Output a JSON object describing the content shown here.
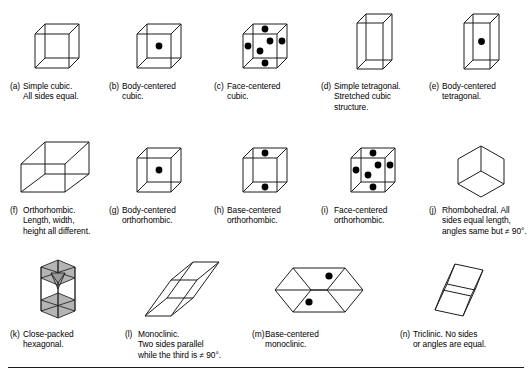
{
  "figure": {
    "rule_color": "#1b1b1b",
    "line_color": "#1d1d1d",
    "shade_color": "#b4b4b4",
    "dot_color": "#000000"
  },
  "rows": [
    {
      "cells": [
        {
          "letter": "(a)",
          "name": "simple-cubic",
          "caption": "Simple cubic.\nAll sides equal.",
          "diagram": "cube-plain",
          "dots": 0
        },
        {
          "letter": "(b)",
          "name": "body-centered-cubic",
          "caption": "Body-centered\ncubic.",
          "diagram": "cube-body-centered",
          "dots": 1
        },
        {
          "letter": "(c)",
          "name": "face-centered-cubic",
          "caption": "Face-centered\ncubic.",
          "diagram": "cube-face-centered",
          "dots": 6
        },
        {
          "letter": "(d)",
          "name": "simple-tetragonal",
          "caption": "Simple tetragonal.\nStretched cubic\nstructure.",
          "diagram": "tetragonal-plain",
          "dots": 0
        },
        {
          "letter": "(e)",
          "name": "body-centered-tetragonal",
          "caption": "Body-centered\ntetragonal.",
          "diagram": "tetragonal-body-centered",
          "dots": 1
        }
      ]
    },
    {
      "cells": [
        {
          "letter": "(f)",
          "name": "orthorhombic",
          "caption": "Orthorhombic.\nLength, width,\nheight all different.",
          "diagram": "orthorhombic-plain",
          "dots": 0
        },
        {
          "letter": "(g)",
          "name": "body-centered-orthorhombic",
          "caption": "Body-centered\northorhombic.",
          "diagram": "cube-body-centered",
          "dots": 1
        },
        {
          "letter": "(h)",
          "name": "base-centered-orthorhombic",
          "caption": "Base-centered\northorhombic.",
          "diagram": "cube-base-centered",
          "dots": 2
        },
        {
          "letter": "(i)",
          "name": "face-centered-orthorhombic",
          "caption": "Face-centered\northorhombic.",
          "diagram": "cube-face-centered",
          "dots": 6
        },
        {
          "letter": "(j)",
          "name": "rhombohedral",
          "caption": "Rhombohedral. All\nsides equal length,\nangles same but ≠ 90°.",
          "diagram": "rhombohedral",
          "dots": 0
        }
      ]
    },
    {
      "cells": [
        {
          "letter": "(k)",
          "name": "close-packed-hexagonal",
          "caption": "Close-packed\nhexagonal.",
          "diagram": "hexagonal-close-packed",
          "dots": 0
        },
        {
          "letter": "(l)",
          "name": "monoclinic",
          "caption": "Monoclinic.\nTwo sides parallel\nwhile the third is ≠ 90°.",
          "diagram": "monoclinic",
          "dots": 0
        },
        {
          "letter": "(m)",
          "name": "base-centered-monoclinic",
          "caption": "Base-centered\nmonoclinic.",
          "diagram": "monoclinic-base-centered",
          "dots": 2
        },
        {
          "letter": "(n)",
          "name": "triclinic",
          "caption": "Triclinic. No sides\nor angles are equal.",
          "diagram": "triclinic",
          "dots": 0
        }
      ]
    }
  ]
}
